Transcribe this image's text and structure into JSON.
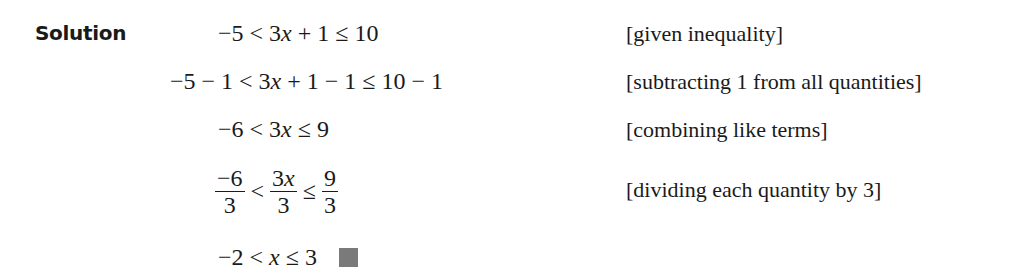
{
  "solution_label": "Solution",
  "steps": [
    {
      "expression": "−5 < 3x + 1 ≤ 10",
      "note": "[given inequality]"
    },
    {
      "expression": "−5 − 1 < 3x + 1 − 1 ≤ 10 − 1",
      "note": "[subtracting 1 from all quantities]"
    },
    {
      "expression": "−6 < 3x ≤ 9",
      "note": "[combining like terms]"
    },
    {
      "expression": "−6/3 < 3x/3 ≤ 9/3",
      "note": "[dividing each quantity by 3]",
      "fractions": [
        {
          "num": "−6",
          "den": "3"
        },
        {
          "num": "3x",
          "den": "3"
        },
        {
          "num": "9",
          "den": "3"
        }
      ],
      "ops": [
        "<",
        "≤"
      ]
    },
    {
      "expression": "−2 < x ≤ 3",
      "note": ""
    }
  ],
  "end_mark": "qed-square",
  "colors": {
    "text": "#1a1a1a",
    "qed": "#7a7a7a"
  }
}
